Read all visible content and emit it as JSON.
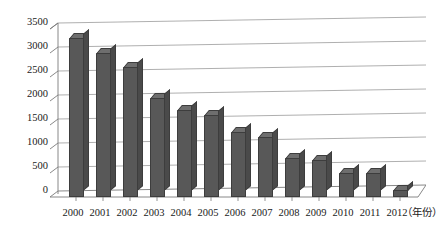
{
  "chart_data": {
    "type": "bar",
    "title": "",
    "xlabel": "（年份）",
    "ylabel": "",
    "categories": [
      "2000",
      "2001",
      "2002",
      "2003",
      "2004",
      "2005",
      "2006",
      "2007",
      "2008",
      "2009",
      "2010",
      "2011",
      "2012"
    ],
    "values": [
      3200,
      2900,
      2620,
      2000,
      1750,
      1650,
      1300,
      1200,
      780,
      750,
      480,
      480,
      150
    ],
    "series": [
      {
        "name": "",
        "values": [
          3200,
          2900,
          2620,
          2000,
          1750,
          1650,
          1300,
          1200,
          780,
          750,
          480,
          480,
          150
        ]
      }
    ],
    "ylim": [
      0,
      3500
    ],
    "ytick_values": [
      0,
      500,
      1000,
      1500,
      2000,
      2500,
      3000,
      3500
    ],
    "ytick_labels": [
      "0",
      "500",
      "1000",
      "1500",
      "2000",
      "2500",
      "3000",
      "3500"
    ],
    "grid": true,
    "legend": null,
    "legend_position": "none",
    "style": "3d-column",
    "bar_color": "#585858",
    "bar_top_color": "#6e6e6e",
    "bar_side_color": "#4a4a4a",
    "grid_color": "#9a9a9a",
    "axis_color": "#7a7a7a",
    "background": "#ffffff"
  }
}
